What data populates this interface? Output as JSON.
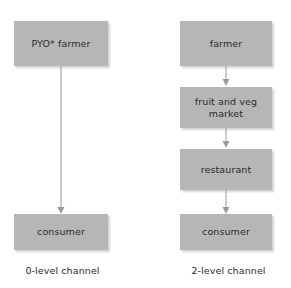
{
  "diagram": {
    "title_visible": false,
    "background_color": "#ffffff",
    "node_fill_color": "#b6b6b6",
    "node_text_color": "#2b2b2b",
    "arrow_color": "#9a9a9a",
    "columns": [
      {
        "id": "left-column",
        "caption": "0-level channel",
        "nodes": [
          {
            "id": "pyo-farmer",
            "label": "PYO* farmer"
          },
          {
            "id": "consumer-left",
            "label": "consumer"
          }
        ],
        "arrows": [
          {
            "from": "pyo-farmer",
            "to": "consumer-left"
          }
        ]
      },
      {
        "id": "right-column",
        "caption": "2-level channel",
        "nodes": [
          {
            "id": "farmer",
            "label": "farmer"
          },
          {
            "id": "fruit-and-veg-market",
            "label": "fruit and veg\nmarket"
          },
          {
            "id": "restaurant",
            "label": "restaurant"
          },
          {
            "id": "consumer-right",
            "label": "consumer"
          }
        ],
        "arrows": [
          {
            "from": "farmer",
            "to": "fruit-and-veg-market"
          },
          {
            "from": "fruit-and-veg-market",
            "to": "restaurant"
          },
          {
            "from": "restaurant",
            "to": "consumer-right"
          }
        ]
      }
    ]
  }
}
